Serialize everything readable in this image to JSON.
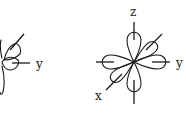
{
  "diagrams": [
    {
      "name": "orbital-left",
      "axes": {
        "y_label": "y"
      }
    },
    {
      "name": "orbital-right",
      "axes": {
        "x_label": "x",
        "y_label": "y",
        "z_label": "z"
      }
    }
  ],
  "colors": {
    "line": "#1a1a1a",
    "background": "#ffffff"
  }
}
